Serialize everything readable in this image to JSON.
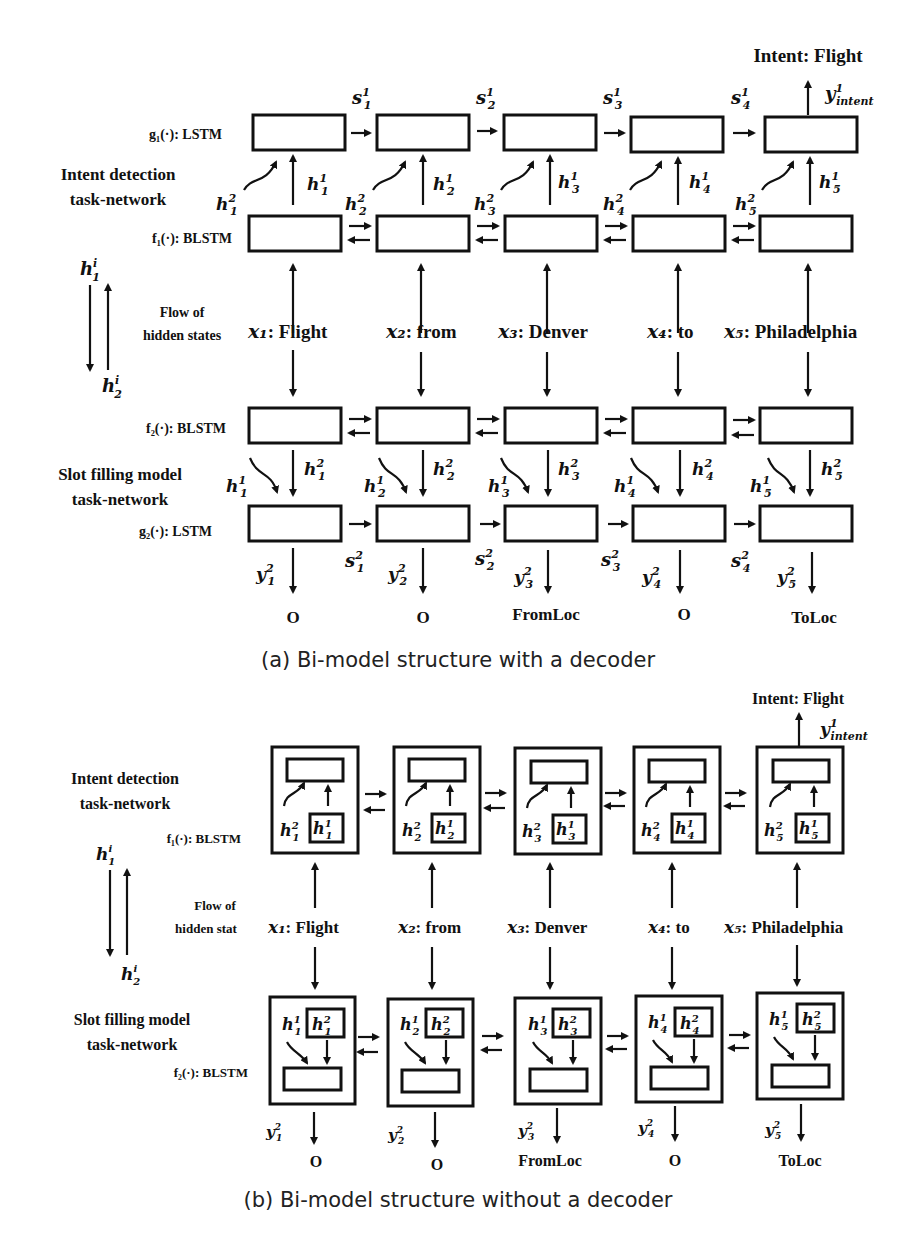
{
  "figure_a": {
    "caption": "(a) Bi-model structure with a decoder",
    "intent_output": "Intent: Flight",
    "intent_symbol": "y",
    "intent_sup": "1",
    "intent_sub": "intent",
    "labels": {
      "g1": "g₁(·): LSTM",
      "f1": "f₁(·): BLSTM",
      "f2": "f₂(·): BLSTM",
      "g2": "g₂(·): LSTM",
      "intent_network_1": "Intent detection",
      "intent_network_2": "task-network",
      "slot_network_1": "Slot filling model",
      "slot_network_2": "task-network",
      "flow_1": "Flow of",
      "flow_2": "hidden states",
      "flow_top": "h",
      "flow_top_sup": "i",
      "flow_top_sub": "1",
      "flow_bottom": "h",
      "flow_bottom_sup": "i",
      "flow_bottom_sub": "2"
    },
    "tokens": [
      {
        "x": "x₁",
        "word": ": Flight",
        "slot": "O"
      },
      {
        "x": "x₂",
        "word": ": from",
        "slot": "O"
      },
      {
        "x": "x₃",
        "word": ": Denver",
        "slot": "FromLoc"
      },
      {
        "x": "x₄",
        "word": ": to",
        "slot": "O"
      },
      {
        "x": "x₅",
        "word": ": Philadelphia",
        "slot": "ToLoc"
      }
    ],
    "s1": [
      "s¹₁",
      "s¹₂",
      "s¹₃",
      "s¹₄"
    ],
    "s2": [
      "s²₁",
      "s²₂",
      "s²₃",
      "s²₄"
    ]
  },
  "figure_b": {
    "caption": "(b) Bi-model structure without a decoder",
    "intent_output": "Intent: Flight",
    "labels": {
      "intent_network_1": "Intent detection",
      "intent_network_2": "task-network",
      "f1": "f₁(·): BLSTM",
      "slot_network_1": "Slot filling model",
      "slot_network_2": "task-network",
      "f2": "f₂(·): BLSTM",
      "flow_1": "Flow of",
      "flow_2": "hidden stat"
    },
    "tokens": [
      {
        "x": "x₁",
        "word": ": Flight",
        "slot": "O"
      },
      {
        "x": "x₂",
        "word": ": from",
        "slot": "O"
      },
      {
        "x": "x₃",
        "word": ": Denver",
        "slot": "FromLoc"
      },
      {
        "x": "x₄",
        "word": ": to",
        "slot": "O"
      },
      {
        "x": "x₅",
        "word": ": Philadelphia",
        "slot": "ToLoc"
      }
    ]
  }
}
